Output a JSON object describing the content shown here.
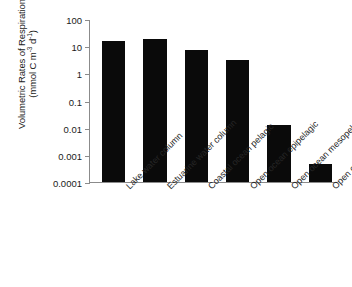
{
  "chart_data": {
    "type": "bar",
    "title": "",
    "subtitle": "",
    "xlabel": "",
    "ylabel": "Volumetric Rates of Respiration (mmol C m-3 d-1)",
    "ylabel_line1": "Volumetric Rates of Respiration",
    "ylabel_line2_prefix": "(mmol C m",
    "ylabel_line2_sup1": "-3",
    "ylabel_line2_mid": " d",
    "ylabel_line2_sup2": "-1",
    "ylabel_line2_suffix": ")",
    "yscale": "log",
    "ylim": [
      0.0001,
      100
    ],
    "ytick_labels": [
      "100",
      "10",
      "1",
      "0.1",
      "0.01",
      "0.001",
      "0.0001"
    ],
    "ytick_values": [
      100,
      10,
      1,
      0.1,
      0.01,
      0.001,
      0.0001
    ],
    "grid": false,
    "legend": false,
    "legend_position": "none",
    "bar_color": "#0a0a0a",
    "axis_color": "#8b8b8b",
    "categories": [
      "Lake water column",
      "Estuarine water column",
      "Coastal ocean pelagic",
      "Open ocean epipelagic",
      "Open ocean mesopelagic",
      "Open ocean bathypelagic"
    ],
    "values": [
      15,
      18,
      7.5,
      3,
      0.013,
      0.00045
    ]
  }
}
